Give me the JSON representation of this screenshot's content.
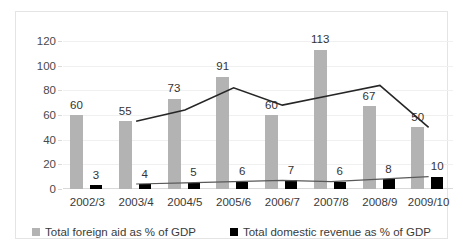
{
  "chart_data": {
    "type": "bar",
    "title": "",
    "xlabel": "",
    "ylabel": "",
    "ylim": [
      0,
      120
    ],
    "yticks": [
      0,
      20,
      40,
      60,
      80,
      100,
      120
    ],
    "grid": true,
    "legend_position": "bottom",
    "categories": [
      "2002/3",
      "2003/4",
      "2004/5",
      "2005/6",
      "2006/7",
      "2007/8",
      "2008/9",
      "2009/10"
    ],
    "series": [
      {
        "name": "Total foreign aid as % of GDP",
        "type": "bar",
        "color": "#b3b3b3",
        "values": [
          60,
          55,
          73,
          91,
          60,
          113,
          67,
          50
        ],
        "labels": [
          "60",
          "55",
          "73",
          "91",
          "60",
          "113",
          "67",
          "50"
        ]
      },
      {
        "name": "Total domestic revenue as % of GDP",
        "type": "bar",
        "color": "#000000",
        "values": [
          3,
          4,
          5,
          6,
          7,
          6,
          8,
          10
        ],
        "labels": [
          "3",
          "4",
          "5",
          "6",
          "7",
          "6",
          "8",
          "10"
        ]
      },
      {
        "name": "foreign-aid-trend-line",
        "type": "line",
        "color": "#262626",
        "values": [
          null,
          55,
          64,
          82,
          68,
          76,
          84,
          50
        ]
      },
      {
        "name": "domestic-revenue-trend-line",
        "type": "line",
        "color": "#595959",
        "values": [
          null,
          4,
          5,
          6,
          7,
          6,
          8,
          10
        ]
      }
    ]
  },
  "legend": {
    "items": [
      {
        "label": "Total foreign aid as % of GDP",
        "color": "#b3b3b3"
      },
      {
        "label": "Total domestic revenue as % of GDP",
        "color": "#000000"
      }
    ]
  }
}
